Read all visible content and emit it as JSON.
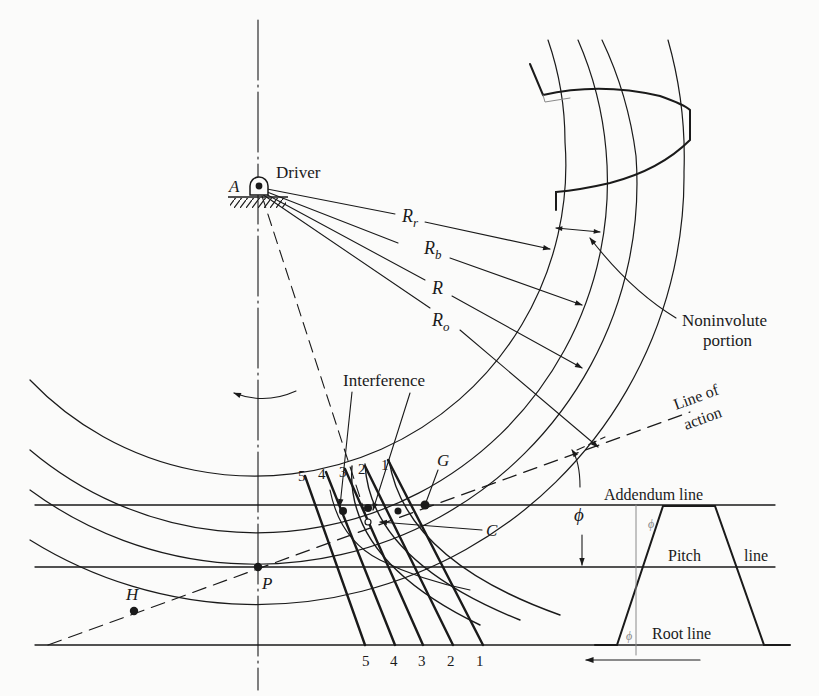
{
  "diagram": {
    "type": "gear-tooth interference / rack generation diagram",
    "labels": {
      "pivot": "A",
      "driver": "Driver",
      "r_root": "R",
      "r_root_sub": "r",
      "r_base": "R",
      "r_base_sub": "b",
      "r_pitch": "R",
      "r_outer": "R",
      "r_outer_sub": "o",
      "noninvolute_1": "Noninvolute",
      "noninvolute_2": "portion",
      "interference": "Interference",
      "line_of_action_1": "Line of",
      "line_of_action_2": "action",
      "point_g": "G",
      "point_c": "C",
      "point_p": "P",
      "point_h": "H",
      "phi": "ϕ",
      "phi_small_1": "ϕ",
      "phi_small_2": "ϕ",
      "addendum_line": "Addendum line",
      "pitch": "Pitch",
      "pitch_line": "line",
      "root_line": "Root line"
    },
    "rack_positions_top": [
      "5",
      "4",
      "3",
      "2",
      "1"
    ],
    "rack_positions_bottom": [
      "5",
      "4",
      "3",
      "2",
      "1"
    ],
    "colors": {
      "ink": "#1a1a1a",
      "paper": "#fbfbfa",
      "faint": "#8a8a8a"
    }
  }
}
